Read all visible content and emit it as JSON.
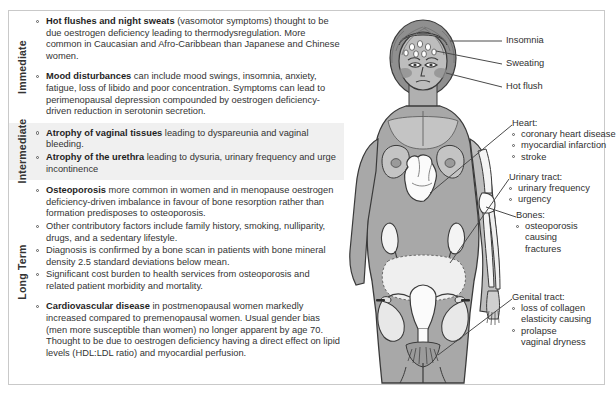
{
  "figure": {
    "image_alt": "Grayscale anatomical illustration of a woman showing head with sweating and hot flush, heart, kidneys, urinary tract, arm bones and pelvis/genital tract"
  },
  "sections": [
    {
      "label": "Immediate",
      "shaded": false,
      "bullets": [
        {
          "lead": "Hot flushes and night sweats",
          "text": " (vasomotor symptoms) thought to be due oestrogen deficiency leading to thermodysregulation.  More common in Caucasian  and Afro-Caribbean than Japanese  and Chinese women.",
          "gap": false
        },
        {
          "lead": "Mood disturbances",
          "text": " can include mood swings, insomnia, anxiety, fatigue, loss of libido and poor concentration. Symptoms can lead to perimenopausal depression compounded by oestrogen deficiency-driven reduction in serotonin secretion.",
          "gap": true
        }
      ]
    },
    {
      "label": "Intermediate",
      "shaded": true,
      "bullets": [
        {
          "lead": "Atrophy of vaginal tissues",
          "text": " leading to dyspareunia and vaginal bleeding.",
          "gap": false
        },
        {
          "lead": "Atrophy of the urethra",
          "text": " leading to dysuria, urinary frequency and urge incontinence",
          "gap": false
        }
      ]
    },
    {
      "label": "Long Term",
      "shaded": false,
      "bullets": [
        {
          "lead": "Osteoporosis",
          "text": " more common in women and in menopause oestrogen deficiency-driven imbalance in favour of bone resorption rather than formation predisposes to osteoporosis.",
          "gap": false
        },
        {
          "lead": "",
          "text": "Other contributory factors include family history, smoking, nulliparity, drugs, and a sedentary lifestyle.",
          "gap": false
        },
        {
          "lead": "",
          "text": "Diagnosis is confirmed by a bone scan in patients with bone mineral density 2.5 standard deviations below mean.",
          "gap": false
        },
        {
          "lead": "",
          "text": "Significant cost burden to health services from osteoporosis and related patient morbidity and mortality.",
          "gap": false
        },
        {
          "lead": "Cardiovascular disease",
          "text": " in postmenopausal women markedly increased compared to premenopausal women. Usual gender bias (men more susceptible than women) no longer apparent by age 70. Thought to be due to oestrogen deficiency having a direct effect on lipid levels (HDL:LDL ratio) and myocardial perfusion.",
          "gap": true
        }
      ]
    }
  ],
  "annotations": [
    {
      "name": "insomnia",
      "heading": "Insomnia",
      "items": []
    },
    {
      "name": "sweating",
      "heading": "Sweating",
      "items": []
    },
    {
      "name": "hot-flush",
      "heading": "Hot flush",
      "items": []
    },
    {
      "name": "heart",
      "heading": "Heart:",
      "items": [
        "coronary heart disease",
        "myocardial infarction",
        "stroke"
      ]
    },
    {
      "name": "urinary-tract",
      "heading": "Urinary tract:",
      "items": [
        "urinary frequency",
        "urgency"
      ]
    },
    {
      "name": "bones",
      "heading": "Bones:",
      "items": [
        "osteoporosis",
        "causing",
        "fractures"
      ]
    },
    {
      "name": "genital-tract",
      "heading": "Genital tract:",
      "items": [
        "loss of collagen",
        "elasticity causing",
        "prolapse",
        "vaginal dryness"
      ]
    }
  ],
  "colors": {
    "border": "#c9c9c9",
    "band_shade": "#f0f0f0",
    "text": "#2b2b2b",
    "skin": "#a8a8a8",
    "skin_light": "#c4c4c4",
    "hair": "#8c8c8c",
    "organ": "#f2f2f2",
    "outline": "#3a3a3a"
  }
}
